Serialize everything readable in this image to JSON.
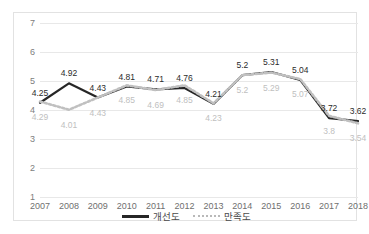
{
  "chart_data": {
    "type": "line",
    "title": "",
    "xlabel": "",
    "ylabel": "",
    "ylim": [
      1,
      7
    ],
    "yticks": [
      "1",
      "2",
      "3",
      "4",
      "5",
      "6",
      "7"
    ],
    "grid": true,
    "legend_position": "bottom",
    "categories": [
      "2007",
      "2008",
      "2009",
      "2010",
      "2011",
      "2012",
      "2013",
      "2014",
      "2015",
      "2016",
      "2017",
      "2018"
    ],
    "series": [
      {
        "name": "개선도",
        "style": "solid",
        "color": "#262626",
        "values": [
          4.25,
          4.92,
          4.43,
          4.81,
          4.71,
          4.76,
          4.21,
          5.2,
          5.31,
          5.04,
          3.72,
          3.62
        ],
        "labels": [
          "4.25",
          "4.92",
          "4.43",
          "4.81",
          "4.71",
          "4.76",
          "4.21",
          "5.2",
          "5.31",
          "5.04",
          "3.72",
          "3.62"
        ]
      },
      {
        "name": "만족도",
        "style": "dotted",
        "color": "#c0c0c0",
        "values": [
          4.29,
          4.01,
          4.43,
          4.85,
          4.69,
          4.85,
          4.23,
          5.2,
          5.29,
          5.07,
          3.8,
          3.54
        ],
        "labels": [
          "4.29",
          "4.01",
          "4.43",
          "4.85",
          "4.69",
          "4.85",
          "4.23",
          "5.2",
          "5.29",
          "5.07",
          "3.8",
          "3.54"
        ]
      }
    ]
  },
  "legend": {
    "items": [
      {
        "label": "개선도"
      },
      {
        "label": "만족도"
      }
    ]
  }
}
